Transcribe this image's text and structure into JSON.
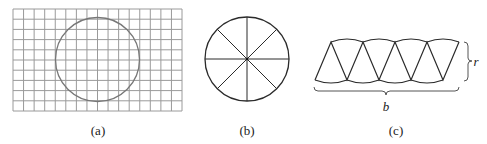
{
  "figure": {
    "panels": [
      {
        "id": "a",
        "label": "(a)",
        "description": "circle drawn on square grid",
        "grid": {
          "columns": 16,
          "rows": 10
        },
        "circle": {
          "cx": 97.5,
          "cy": 59.5,
          "r": 42
        }
      },
      {
        "id": "b",
        "label": "(b)",
        "description": "circle divided into 8 equal sectors",
        "sectors": 8,
        "circle": {
          "cx": 247,
          "cy": 59,
          "r": 42
        }
      },
      {
        "id": "c",
        "label": "(c)",
        "description": "sectors rearranged into approximate parallelogram",
        "sectors": 8,
        "height_label": "r",
        "base_label": "b"
      }
    ]
  },
  "colors": {
    "grid": "#9a9a9a",
    "circle_a": "#777777",
    "line": "#2a2a2a",
    "text": "#222222"
  }
}
